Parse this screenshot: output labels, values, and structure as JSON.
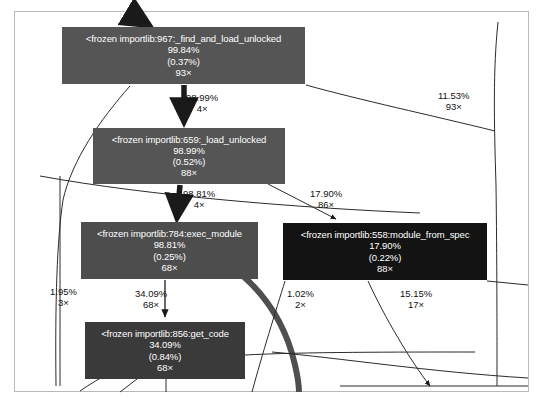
{
  "graph": {
    "title": "profiler call graph",
    "background": "#ffffff",
    "frame_color": "#b9b9b9",
    "nodes": [
      {
        "id": "find_and_load_unlocked",
        "name": "<frozen importlib:967:_find_and_load_unlocked",
        "total": "99.84%",
        "self": "(0.37%)",
        "calls": "93×",
        "color": "#555555",
        "x": 62,
        "y": 27,
        "w": 243,
        "h": 57
      },
      {
        "id": "load_unlocked",
        "name": "<frozen importlib:659:_load_unlocked",
        "total": "98.99%",
        "self": "(0.52%)",
        "calls": "88×",
        "color": "#555555",
        "x": 93,
        "y": 128,
        "w": 192,
        "h": 56
      },
      {
        "id": "exec_module",
        "name": "<frozen importlib:784:exec_module",
        "total": "98.81%",
        "self": "(0.25%)",
        "calls": "68×",
        "color": "#4d4d4d",
        "x": 81,
        "y": 222,
        "w": 177,
        "h": 57
      },
      {
        "id": "module_from_spec",
        "name": "<frozen importlib:558:module_from_spec",
        "total": "17.90%",
        "self": "(0.22%)",
        "calls": "88×",
        "color": "#131313",
        "x": 283,
        "y": 223,
        "w": 204,
        "h": 57
      },
      {
        "id": "get_code",
        "name": "<frozen importlib:856:get_code",
        "total": "34.09%",
        "self": "(0.84%)",
        "calls": "68×",
        "color": "#3a3a3a",
        "x": 85,
        "y": 322,
        "w": 160,
        "h": 57
      }
    ],
    "edges": [
      {
        "id": "e1",
        "from": "find_and_load_unlocked",
        "to": "load_unlocked",
        "pct": "98.99%",
        "count": "4×",
        "lx": 186,
        "ly": 92
      },
      {
        "id": "e2",
        "from": "find_and_load_unlocked",
        "to": "right-exit",
        "pct": "11.53%",
        "count": "93×",
        "lx": 438,
        "ly": 90
      },
      {
        "id": "e3",
        "from": "load_unlocked",
        "to": "exec_module",
        "pct": "98.81%",
        "count": "4×",
        "lx": 183,
        "ly": 188
      },
      {
        "id": "e4",
        "from": "load_unlocked",
        "to": "module_from_spec",
        "pct": "17.90%",
        "count": "86×",
        "lx": 310,
        "ly": 188
      },
      {
        "id": "e5",
        "from": "exec_module",
        "to": "left-exit",
        "pct": "1.95%",
        "count": "3×",
        "lx": 50,
        "ly": 286
      },
      {
        "id": "e6",
        "from": "exec_module",
        "to": "get_code",
        "pct": "34.09%",
        "count": "68×",
        "lx": 135,
        "ly": 288
      },
      {
        "id": "e7",
        "from": "module_from_spec",
        "to": "below-left",
        "pct": "1.02%",
        "count": "2×",
        "lx": 287,
        "ly": 288
      },
      {
        "id": "e8",
        "from": "module_from_spec",
        "to": "below-right",
        "pct": "15.15%",
        "count": "17×",
        "lx": 400,
        "ly": 288
      }
    ]
  }
}
